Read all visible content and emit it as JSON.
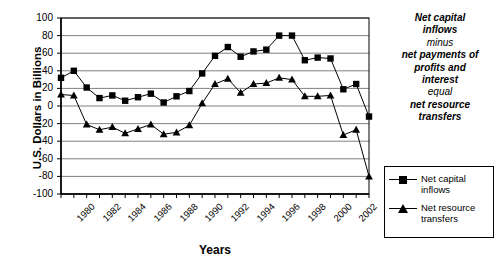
{
  "chart_data": {
    "type": "line",
    "title": "",
    "xlabel": "Years",
    "ylabel": "U.S. Dollars in Billions",
    "ylim": [
      -100,
      100
    ],
    "ytick_step": 20,
    "grid": true,
    "legend_position": "right",
    "x": [
      1980,
      1981,
      1982,
      1983,
      1984,
      1985,
      1986,
      1987,
      1988,
      1989,
      1990,
      1991,
      1992,
      1993,
      1994,
      1995,
      1996,
      1997,
      1998,
      1999,
      2000,
      2001,
      2002,
      2003,
      2004
    ],
    "xtick_labels": [
      "1980",
      "1982",
      "1984",
      "1986",
      "1988",
      "1990",
      "1992",
      "1994",
      "1996",
      "1998",
      "2000",
      "2002",
      "2004"
    ],
    "yticks": [
      100,
      80,
      60,
      40,
      20,
      0,
      -20,
      -40,
      -60,
      -80,
      -100
    ],
    "series": [
      {
        "name": "Net capital inflows",
        "marker": "square",
        "values": [
          32,
          40,
          21,
          9,
          12,
          6,
          10,
          14,
          4,
          11,
          17,
          37,
          57,
          67,
          56,
          62,
          64,
          80,
          80,
          52,
          55,
          54,
          19,
          25,
          -12
        ]
      },
      {
        "name": "Net resource transfers",
        "marker": "triangle",
        "values": [
          13,
          12,
          -21,
          -27,
          -24,
          -31,
          -26,
          -21,
          -32,
          -30,
          -22,
          3,
          25,
          31,
          15,
          25,
          26,
          32,
          30,
          11,
          11,
          12,
          -33,
          -27,
          -80
        ]
      }
    ]
  },
  "annotation": {
    "lines": [
      {
        "text": "Net capital",
        "emphasis": "strong"
      },
      {
        "text": "inflows",
        "emphasis": "strong"
      },
      {
        "text": "minus",
        "emphasis": "weak"
      },
      {
        "text": "net payments of",
        "emphasis": "strong"
      },
      {
        "text": "profits and",
        "emphasis": "strong"
      },
      {
        "text": "interest",
        "emphasis": "strong"
      },
      {
        "text": "equal",
        "emphasis": "weak"
      },
      {
        "text": "net resource",
        "emphasis": "strong"
      },
      {
        "text": "transfers",
        "emphasis": "strong"
      }
    ]
  },
  "legend": {
    "items": [
      {
        "label": "Net capital inflows",
        "marker": "square"
      },
      {
        "label": "Net resource transfers",
        "marker": "triangle"
      }
    ]
  },
  "colors": {
    "axis": "#000000",
    "grid": "#808080",
    "series": "#000000",
    "background": "#ffffff"
  }
}
